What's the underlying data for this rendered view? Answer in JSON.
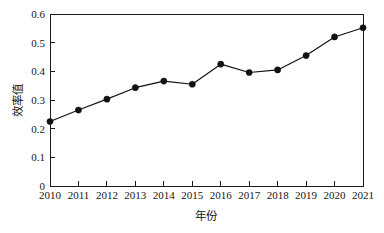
{
  "chart_data": {
    "type": "line",
    "title": "",
    "subtitle": "",
    "xlabel": "年份",
    "ylabel": "效率值",
    "categories": [
      "2010",
      "2011",
      "2012",
      "2013",
      "2014",
      "2015",
      "2016",
      "2017",
      "2018",
      "2019",
      "2020",
      "2021"
    ],
    "x": [
      2010,
      2011,
      2012,
      2013,
      2014,
      2015,
      2016,
      2017,
      2018,
      2019,
      2020,
      2021
    ],
    "values": [
      0.225,
      0.265,
      0.303,
      0.343,
      0.366,
      0.355,
      0.425,
      0.396,
      0.405,
      0.455,
      0.52,
      0.552
    ],
    "series": [
      {
        "name": "效率值",
        "values": [
          0.225,
          0.265,
          0.303,
          0.343,
          0.366,
          0.355,
          0.425,
          0.396,
          0.405,
          0.455,
          0.52,
          0.552
        ],
        "color": "#111111",
        "marker": "filled-circle",
        "line_style": "solid"
      }
    ],
    "ylim": [
      0,
      0.6
    ],
    "yticks": [
      0,
      0.1,
      0.2,
      0.3,
      0.4,
      0.5,
      0.6
    ],
    "ytick_labels": [
      "0",
      "0.1",
      "0.2",
      "0.3",
      "0.4",
      "0.5",
      "0.6"
    ],
    "xtick_labels": [
      "2010",
      "2011",
      "2012",
      "2013",
      "2014",
      "2015",
      "2016",
      "2017",
      "2018",
      "2019",
      "2020",
      "2021"
    ],
    "grid": false,
    "legend": null,
    "legend_position": "none",
    "annotations": [],
    "frame": "box",
    "background_color": "#ffffff",
    "axis_color": "#1a1a1a"
  }
}
